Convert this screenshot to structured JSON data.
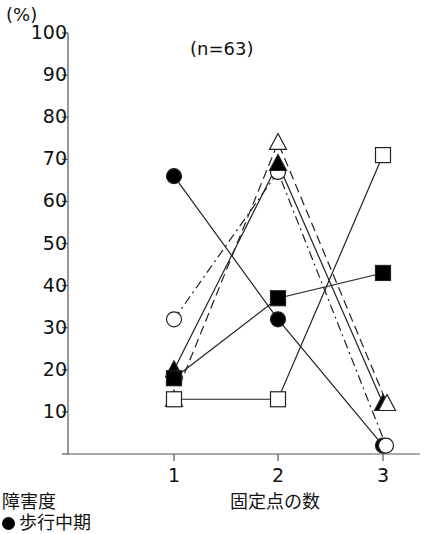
{
  "chart_data": {
    "type": "line",
    "title": "",
    "annotation": "(n=63)",
    "xlabel": "固定点の数",
    "ylabel": "(%)",
    "x": [
      1,
      2,
      3
    ],
    "xticks": [
      "1",
      "2",
      "3"
    ],
    "yticks": [
      "100",
      "90",
      "80",
      "70",
      "60",
      "50",
      "40",
      "30",
      "20",
      "10"
    ],
    "ylim": [
      0,
      100
    ],
    "grid": false,
    "legend_title": "障害度",
    "legend_position": "bottom-left",
    "legend_visible_entries": [
      "歩行中期"
    ],
    "series": [
      {
        "name": "歩行中期",
        "marker": "filled-circle",
        "line": "solid",
        "values": [
          66,
          32,
          2
        ]
      },
      {
        "name": "",
        "marker": "open-circle",
        "line": "dash-dot",
        "values": [
          32,
          67,
          2
        ]
      },
      {
        "name": "",
        "marker": "filled-triangle",
        "line": "solid",
        "values": [
          20,
          69,
          12
        ]
      },
      {
        "name": "",
        "marker": "open-triangle",
        "line": "dashed",
        "values": [
          13,
          74,
          12
        ]
      },
      {
        "name": "",
        "marker": "filled-square",
        "line": "solid",
        "values": [
          18,
          37,
          43
        ]
      },
      {
        "name": "",
        "marker": "open-square",
        "line": "solid",
        "values": [
          13,
          13,
          71
        ]
      }
    ]
  },
  "labels": {
    "y_unit": "(%)",
    "n": "(n=63)",
    "x_title": "固定点の数",
    "legend_title": "障害度",
    "legend_item_0": "歩行中期"
  }
}
